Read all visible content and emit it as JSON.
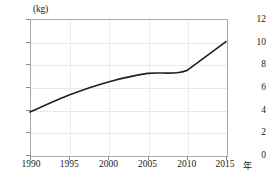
{
  "chart_data": {
    "type": "line",
    "title": "",
    "subtitle": "",
    "xlabel": "年",
    "ylabel": "(kg)",
    "x": [
      1990,
      1995,
      2000,
      2005,
      2010,
      2015
    ],
    "xtick_labels": [
      "1990",
      "1995",
      "2000",
      "2005",
      "2010",
      "2015"
    ],
    "ytick_labels": [
      "0",
      "2",
      "4",
      "6",
      "8",
      "10",
      "12"
    ],
    "ytick_values": [
      0,
      2,
      4,
      6,
      8,
      10,
      12
    ],
    "xlim": [
      1990,
      2015
    ],
    "ylim": [
      0,
      12
    ],
    "grid": true,
    "legend": "none",
    "series": [
      {
        "name": "",
        "color": "#1f1f1f",
        "values": [
          3.8,
          5.3,
          6.45,
          7.2,
          7.45,
          10.0
        ]
      }
    ]
  },
  "axes": {
    "y_unit_label": "(kg)",
    "x_unit_label": "年"
  }
}
